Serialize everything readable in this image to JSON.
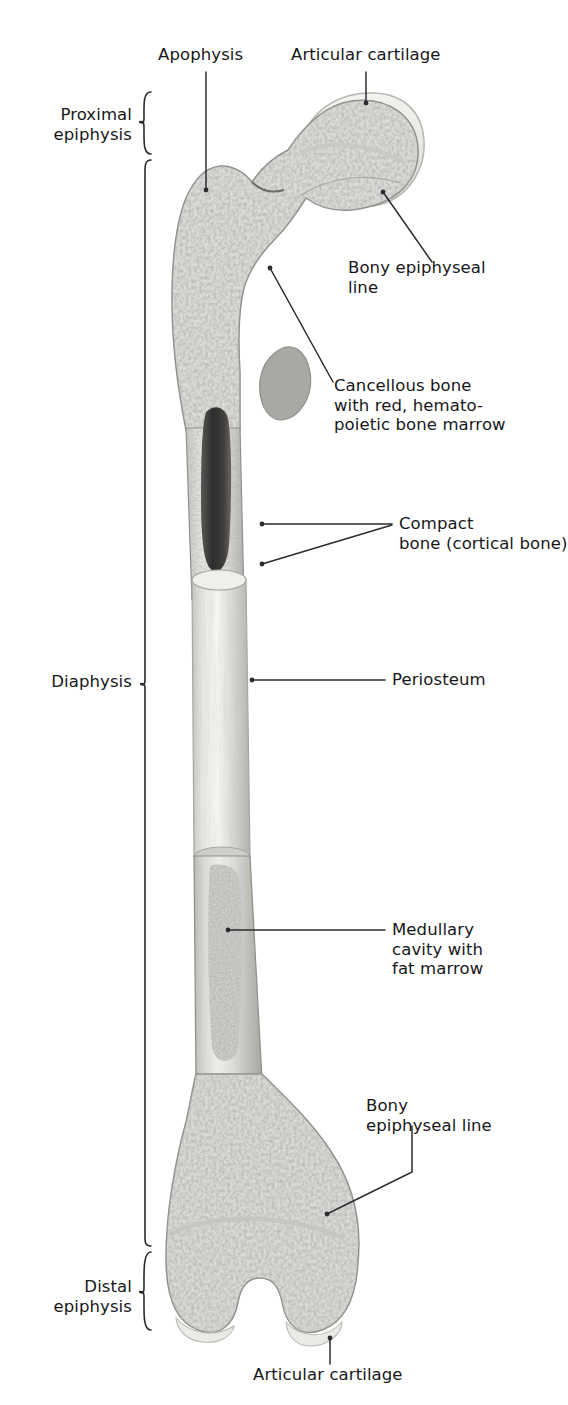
{
  "figure": {
    "ink_color": "#17171a",
    "leader_color": "#2b2b30",
    "background": "#ffffff"
  },
  "brackets": [
    {
      "id": "proximal-epiphysis",
      "label": "Proximal\nepiphysis"
    },
    {
      "id": "diaphysis",
      "label": "Diaphysis"
    },
    {
      "id": "distal-epiphysis",
      "label": "Distal\nepiphysis"
    }
  ],
  "callouts": [
    {
      "id": "apophysis",
      "label": "Apophysis"
    },
    {
      "id": "articular-cartilage-top",
      "label": "Articular cartilage"
    },
    {
      "id": "bony-epiphyseal-line-top",
      "label": "Bony epiphyseal\nline"
    },
    {
      "id": "cancellous-bone",
      "label": "Cancellous bone\nwith red, hemato-\npoietic bone marrow"
    },
    {
      "id": "compact-bone",
      "label": "Compact\nbone (cortical bone)"
    },
    {
      "id": "periosteum",
      "label": "Periosteum"
    },
    {
      "id": "medullary-cavity",
      "label": "Medullary\ncavity with\nfat marrow"
    },
    {
      "id": "bony-epiphyseal-line-bottom",
      "label": "Bony\nepiphyseal line"
    },
    {
      "id": "articular-cartilage-bottom",
      "label": "Articular cartilage"
    }
  ]
}
